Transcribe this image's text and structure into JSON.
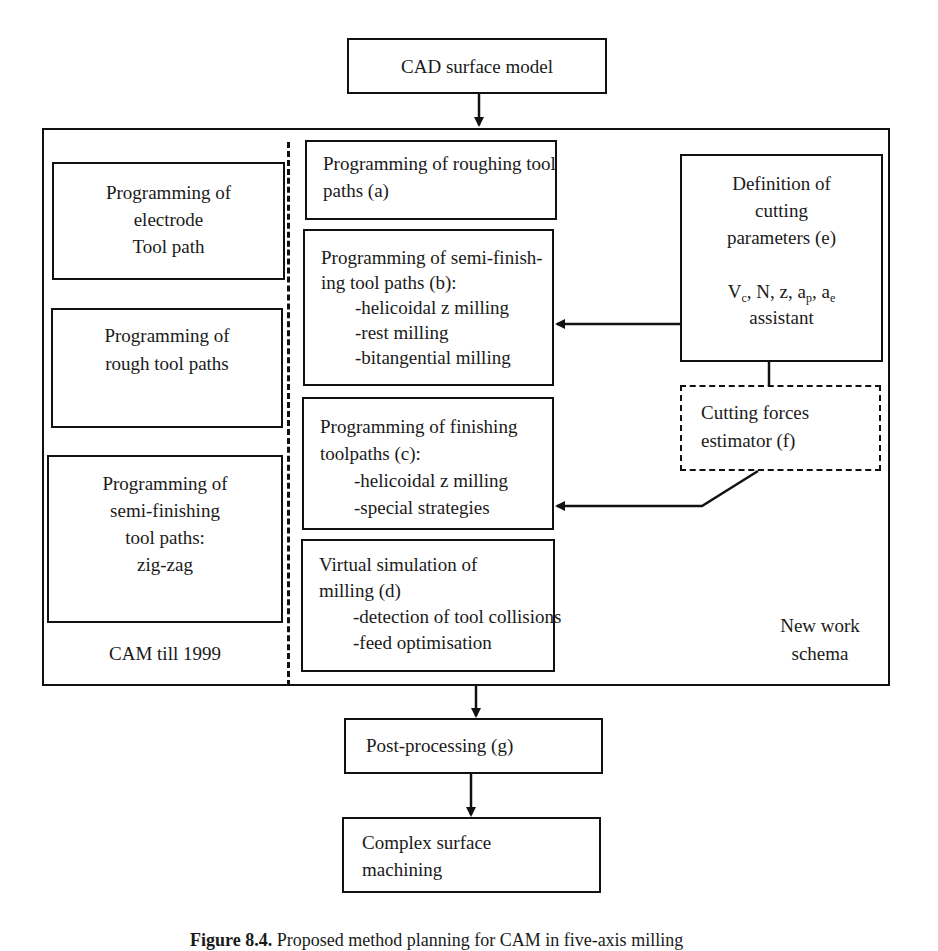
{
  "diagram": {
    "top_box": {
      "label": "CAD surface model"
    },
    "left_column": {
      "boxes": [
        {
          "lines": [
            "Programming of",
            "electrode",
            "Tool path"
          ]
        },
        {
          "lines": [
            "Programming of",
            "rough tool paths"
          ]
        },
        {
          "lines": [
            "Programming of",
            "semi-finishing",
            "tool paths:",
            "zig-zag"
          ]
        }
      ],
      "label": "CAM till 1999"
    },
    "middle_column": {
      "boxes": [
        {
          "lines": [
            "Programming of roughing tool",
            "paths (a)"
          ],
          "items": []
        },
        {
          "lines": [
            "Programming of semi-finish-",
            "ing tool paths (b):"
          ],
          "items": [
            "-helicoidal z milling",
            "-rest milling",
            "-bitangential milling"
          ]
        },
        {
          "lines": [
            "Programming of finishing",
            "toolpaths (c):"
          ],
          "items": [
            "-helicoidal z milling",
            "-special strategies"
          ]
        },
        {
          "lines": [
            "Virtual simulation of",
            "milling (d)"
          ],
          "items": [
            "-detection of tool collisions",
            "-feed optimisation"
          ]
        }
      ]
    },
    "right_column": {
      "cutting_params_box": {
        "lines": [
          "Definition of",
          "cutting",
          "parameters (e)"
        ],
        "params": {
          "vc": "V",
          "vc_sub": "c",
          "rest1": ", N, z, a",
          "ap_sub": "p",
          "rest2": ", a",
          "ae_sub": "e"
        },
        "assistant": "assistant"
      },
      "forces_box": {
        "lines": [
          "Cutting forces",
          "estimator (f)"
        ]
      },
      "label_lines": [
        "New work",
        "schema"
      ]
    },
    "post_box": {
      "label": "Post-processing (g)"
    },
    "bottom_box": {
      "lines": [
        "Complex surface",
        "machining"
      ]
    }
  },
  "caption": {
    "prefix": "Figure 8.4.",
    "text": " Proposed method planning for CAM in five-axis milling"
  }
}
